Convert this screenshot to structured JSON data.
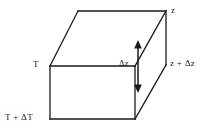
{
  "figure": {
    "type": "line-diagram",
    "background_color": "#ffffff",
    "stroke_color": "#1a1a1a",
    "geometry": {
      "description": "Rectangular parallelepiped (slab element) drawn in oblique projection",
      "vertices": {
        "top_back_left": [
          78,
          11
        ],
        "top_back_right": [
          166,
          11
        ],
        "top_front_right": [
          135,
          66
        ],
        "top_front_left": [
          50,
          66
        ],
        "bottom_front_left": [
          50,
          119
        ],
        "bottom_front_right": [
          135,
          119
        ],
        "bottom_back_right": [
          166,
          65
        ]
      },
      "faces": [
        "top",
        "front",
        "right"
      ]
    },
    "labels": {
      "z_top": "z",
      "z_plus_dz": "z + Δz",
      "delta_z": "Δz",
      "temperature": "T",
      "temperature_plus_dt": "T + ΔT"
    },
    "arrow": {
      "name": "delta-z-dimension-arrow",
      "style": "double-headed vertical",
      "x": 138,
      "y_top": 42,
      "y_bottom": 91,
      "measures": "Δz"
    }
  }
}
